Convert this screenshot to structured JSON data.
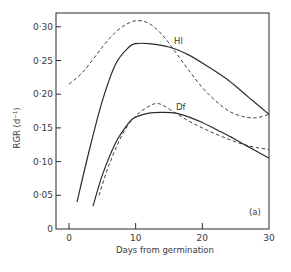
{
  "chart_data": {
    "type": "line",
    "title": "",
    "panel_label": "(a)",
    "xlabel": "Days from germination",
    "ylabel": "RGR (d⁻¹)",
    "xlim": [
      -2.5,
      30
    ],
    "ylim": [
      0,
      0.32
    ],
    "grid": false,
    "legend": "inline labels",
    "x_ticks": [
      0,
      10,
      20,
      30
    ],
    "x_tick_labels": [
      "0",
      "10",
      "20",
      "30"
    ],
    "y_ticks": [
      0,
      0.05,
      0.1,
      0.15,
      0.2,
      0.25,
      0.3
    ],
    "y_tick_labels": [
      "0",
      "0·05",
      "0·10",
      "0·15",
      "0·20",
      "0·25",
      "0·30"
    ],
    "series": [
      {
        "name": "Hl (solid)",
        "label": "Hl",
        "style": "solid",
        "x": [
          1.2,
          3,
          5,
          7,
          9,
          10,
          12,
          15,
          18,
          21,
          24,
          27,
          30
        ],
        "y": [
          0.04,
          0.115,
          0.19,
          0.245,
          0.27,
          0.275,
          0.275,
          0.27,
          0.258,
          0.24,
          0.22,
          0.195,
          0.17
        ]
      },
      {
        "name": "Hl (dashed)",
        "label": "Hl",
        "style": "dashed",
        "x": [
          0,
          2,
          4,
          6,
          8,
          10,
          12,
          14,
          16,
          18,
          20,
          22,
          24,
          26,
          28,
          30
        ],
        "y": [
          0.215,
          0.232,
          0.257,
          0.282,
          0.3,
          0.309,
          0.305,
          0.288,
          0.262,
          0.235,
          0.21,
          0.19,
          0.175,
          0.167,
          0.165,
          0.17
        ]
      },
      {
        "name": "Df (solid)",
        "label": "Df",
        "style": "solid",
        "x": [
          3.6,
          5,
          7,
          9,
          10,
          12,
          14,
          16,
          18,
          20,
          22,
          24,
          26,
          28,
          30
        ],
        "y": [
          0.034,
          0.08,
          0.128,
          0.158,
          0.166,
          0.172,
          0.173,
          0.172,
          0.166,
          0.158,
          0.148,
          0.138,
          0.127,
          0.116,
          0.105
        ]
      },
      {
        "name": "Df (dashed)",
        "label": "Df",
        "style": "dashed",
        "x": [
          4.5,
          6,
          8,
          10,
          12,
          13,
          14,
          16,
          18,
          20,
          22,
          24,
          26,
          28,
          30
        ],
        "y": [
          0.05,
          0.095,
          0.14,
          0.168,
          0.182,
          0.186,
          0.184,
          0.172,
          0.16,
          0.15,
          0.141,
          0.133,
          0.126,
          0.121,
          0.118
        ]
      }
    ]
  },
  "labels": {
    "hl": "Hl",
    "df": "Df",
    "panel": "(a)",
    "xlabel": "Days from germination",
    "ylabel": "RGR (d⁻¹)"
  }
}
